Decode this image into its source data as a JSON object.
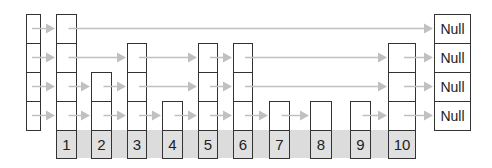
{
  "colors": {
    "arrow": "#c0c0c0",
    "band": "#dcdcdc",
    "key_fill": "#e0e0e0",
    "border": "#333333"
  },
  "layout": {
    "row_tops": [
      14,
      43,
      72,
      101
    ],
    "row_height": 29,
    "key_top": 130,
    "key_height": 28
  },
  "header": {
    "x": 26,
    "w": 15,
    "levels": 4
  },
  "band": {
    "x": 57,
    "y": 130,
    "w": 355,
    "h": 28
  },
  "nodes": [
    {
      "key": "1",
      "x": 56,
      "w": 21,
      "levels": 4
    },
    {
      "key": "2",
      "x": 91,
      "w": 21,
      "levels": 2
    },
    {
      "key": "3",
      "x": 127,
      "w": 20,
      "levels": 3
    },
    {
      "key": "4",
      "x": 162,
      "w": 21,
      "levels": 1
    },
    {
      "key": "5",
      "x": 198,
      "w": 20,
      "levels": 3
    },
    {
      "key": "6",
      "x": 233,
      "w": 20,
      "levels": 3
    },
    {
      "key": "7",
      "x": 269,
      "w": 21,
      "levels": 1
    },
    {
      "key": "8",
      "x": 310,
      "w": 22,
      "levels": 1
    },
    {
      "key": "9",
      "x": 350,
      "w": 21,
      "levels": 1
    },
    {
      "key": "10",
      "x": 388,
      "w": 28,
      "levels": 3
    }
  ],
  "null_column": {
    "x": 434,
    "w": 37,
    "label": "Null",
    "labels": [
      "Null",
      "Null",
      "Null",
      "Null"
    ]
  },
  "links": [
    {
      "level": 4,
      "from": "header",
      "to": "1"
    },
    {
      "level": 4,
      "from": "1",
      "to": "null"
    },
    {
      "level": 3,
      "from": "header",
      "to": "1"
    },
    {
      "level": 3,
      "from": "1",
      "to": "3"
    },
    {
      "level": 3,
      "from": "3",
      "to": "5"
    },
    {
      "level": 3,
      "from": "5",
      "to": "6"
    },
    {
      "level": 3,
      "from": "6",
      "to": "10"
    },
    {
      "level": 3,
      "from": "10",
      "to": "null"
    },
    {
      "level": 2,
      "from": "header",
      "to": "1"
    },
    {
      "level": 2,
      "from": "1",
      "to": "2"
    },
    {
      "level": 2,
      "from": "2",
      "to": "3"
    },
    {
      "level": 2,
      "from": "3",
      "to": "5"
    },
    {
      "level": 2,
      "from": "5",
      "to": "6"
    },
    {
      "level": 2,
      "from": "6",
      "to": "10"
    },
    {
      "level": 2,
      "from": "10",
      "to": "null"
    },
    {
      "level": 1,
      "from": "header",
      "to": "1"
    },
    {
      "level": 1,
      "from": "1",
      "to": "2"
    },
    {
      "level": 1,
      "from": "2",
      "to": "3"
    },
    {
      "level": 1,
      "from": "3",
      "to": "4"
    },
    {
      "level": 1,
      "from": "4",
      "to": "5"
    },
    {
      "level": 1,
      "from": "5",
      "to": "6"
    },
    {
      "level": 1,
      "from": "6",
      "to": "7"
    },
    {
      "level": 1,
      "from": "7",
      "to": "8"
    },
    {
      "level": 1,
      "from": "9",
      "to": "10"
    },
    {
      "level": 1,
      "from": "10",
      "to": "null"
    }
  ]
}
